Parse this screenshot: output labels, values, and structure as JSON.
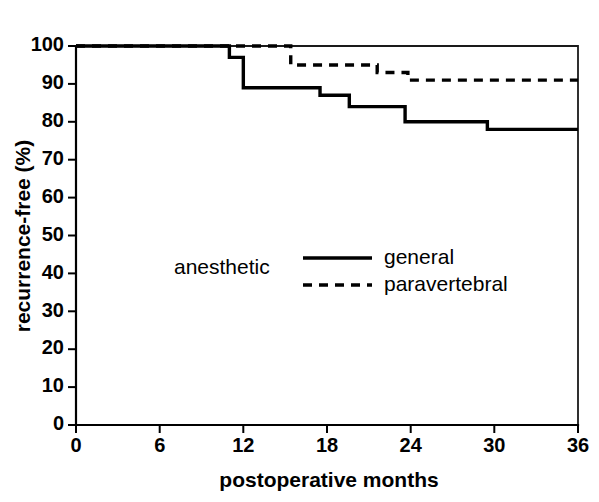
{
  "chart_data": {
    "type": "line",
    "title": "",
    "subtitle": "",
    "xlabel": "postoperative months",
    "ylabel": "recurrence-free (%)",
    "xlim": [
      0,
      36
    ],
    "ylim": [
      0,
      100
    ],
    "xticks": [
      0,
      6,
      12,
      18,
      24,
      30,
      36
    ],
    "xtick_labels": [
      "0",
      "6",
      "12",
      "18",
      "24",
      "30",
      "36"
    ],
    "yticks": [
      0,
      10,
      20,
      30,
      40,
      50,
      60,
      70,
      80,
      90,
      100
    ],
    "ytick_labels": [
      "0",
      "10",
      "20",
      "30",
      "40",
      "50",
      "60",
      "70",
      "80",
      "90",
      "100"
    ],
    "grid": false,
    "legend_position": "center-left-inside",
    "legend_title": "anesthetic",
    "axis_color": "#000000",
    "series": [
      {
        "name": "general",
        "style": "solid",
        "color": "#000000",
        "step_type": "post",
        "x": [
          0,
          11.0,
          12.0,
          17.5,
          19.6,
          23.6,
          29.5,
          36.0
        ],
        "y": [
          100,
          97,
          89,
          87,
          84,
          80,
          78,
          78
        ]
      },
      {
        "name": "paravertebral",
        "style": "dashed",
        "color": "#000000",
        "step_type": "post",
        "x": [
          0,
          15.4,
          21.6,
          23.8,
          36.0
        ],
        "y": [
          100,
          95,
          93,
          91,
          91
        ]
      }
    ]
  },
  "legend": {
    "group_label": "anesthetic",
    "entries": [
      {
        "label": "general",
        "style": "solid"
      },
      {
        "label": "paravertebral",
        "style": "dashed"
      }
    ]
  },
  "axes": {
    "x_title": "postoperative months",
    "y_title": "recurrence-free (%)"
  }
}
